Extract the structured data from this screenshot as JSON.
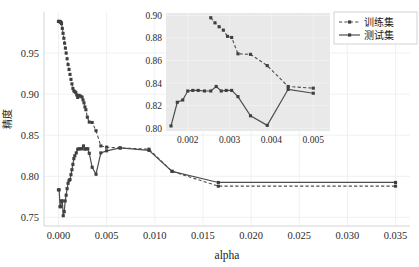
{
  "figure": {
    "background_color": "#ffffff",
    "line_color": "#4d4d4d",
    "marker_color": "#3f3f3f",
    "grid_color": "#eceff1",
    "inset_background_color": "#e9e9e9"
  },
  "legend": {
    "position": "top-right",
    "entries": [
      {
        "label": "训练集",
        "style": "dashed",
        "marker": "square"
      },
      {
        "label": "测试集",
        "style": "solid",
        "marker": "square"
      }
    ]
  },
  "chart_data": {
    "type": "line",
    "title": "",
    "xlabel": "alpha",
    "ylabel": "精度",
    "xlim": [
      -0.0015,
      0.0365
    ],
    "ylim": [
      0.7395,
      1.0
    ],
    "xticks": [
      0.0,
      0.005,
      0.01,
      0.015,
      0.02,
      0.025,
      0.03,
      0.035
    ],
    "xticklabels": [
      "0.000",
      "0.005",
      "0.010",
      "0.015",
      "0.020",
      "0.025",
      "0.030",
      "0.035"
    ],
    "yticks": [
      0.75,
      0.8,
      0.85,
      0.9,
      0.95
    ],
    "yticklabels": [
      "0.75",
      "0.80",
      "0.85",
      "0.90",
      "0.95"
    ],
    "grid": true,
    "legend_position": "upper right",
    "series": [
      {
        "name": "训练集",
        "style": "dashed",
        "marker": "square",
        "x": [
          0.0,
          4e-05,
          8e-05,
          0.00012,
          0.00016,
          0.0002,
          0.00024,
          0.00028,
          0.00032,
          0.0004,
          0.00048,
          0.00056,
          0.00064,
          0.00072,
          0.0008,
          0.0009,
          0.001,
          0.0011,
          0.0012,
          0.0013,
          0.0014,
          0.0015,
          0.0016,
          0.0017,
          0.0018,
          0.0019,
          0.002,
          0.00215,
          0.0023,
          0.00245,
          0.00255,
          0.00265,
          0.00275,
          0.00285,
          0.003,
          0.0032,
          0.0035,
          0.0039,
          0.0044,
          0.005,
          0.0064,
          0.0094,
          0.0118,
          0.0166,
          0.035
        ],
        "y": [
          0.9885,
          0.9885,
          0.9885,
          0.9885,
          0.9882,
          0.988,
          0.9876,
          0.987,
          0.9858,
          0.98,
          0.974,
          0.968,
          0.962,
          0.956,
          0.95,
          0.943,
          0.936,
          0.93,
          0.924,
          0.918,
          0.9125,
          0.907,
          0.904,
          0.903,
          0.902,
          0.899,
          0.896,
          0.8985,
          0.8975,
          0.8965,
          0.893,
          0.8895,
          0.8845,
          0.881,
          0.872,
          0.866,
          0.8655,
          0.8555,
          0.837,
          0.8355,
          0.8345,
          0.833,
          0.806,
          0.788,
          0.788
        ]
      },
      {
        "name": "测试集",
        "style": "solid",
        "marker": "square",
        "x": [
          0.0,
          8e-05,
          0.00016,
          0.00024,
          0.00032,
          0.0004,
          0.0005,
          0.0006,
          0.0007,
          0.0008,
          0.0009,
          0.001,
          0.0011,
          0.0012,
          0.0013,
          0.0014,
          0.0015,
          0.0016,
          0.0017,
          0.00185,
          0.002,
          0.00215,
          0.0023,
          0.00245,
          0.0026,
          0.00275,
          0.0029,
          0.00305,
          0.0032,
          0.0035,
          0.0039,
          0.0044,
          0.005,
          0.0064,
          0.0094,
          0.0118,
          0.0166,
          0.035
        ],
        "y": [
          0.7835,
          0.7835,
          0.763,
          0.763,
          0.77,
          0.77,
          0.752,
          0.757,
          0.77,
          0.777,
          0.785,
          0.7915,
          0.795,
          0.796,
          0.802,
          0.808,
          0.8145,
          0.8215,
          0.825,
          0.8285,
          0.833,
          0.8335,
          0.8335,
          0.8335,
          0.837,
          0.833,
          0.8335,
          0.8335,
          0.828,
          0.811,
          0.8025,
          0.8285,
          0.831,
          0.8345,
          0.8315,
          0.806,
          0.7925,
          0.7925
        ]
      }
    ],
    "inset": {
      "xlim": [
        0.00148,
        0.0054
      ],
      "ylim": [
        0.7975,
        0.9022
      ],
      "xticks": [
        0.002,
        0.003,
        0.004,
        0.005
      ],
      "xticklabels": [
        "0.002",
        "0.003",
        "0.004",
        "0.005"
      ],
      "yticks": [
        0.8,
        0.82,
        0.84,
        0.86,
        0.88,
        0.9
      ],
      "yticklabels": [
        "0.80",
        "0.82",
        "0.84",
        "0.86",
        "0.88",
        "0.90"
      ],
      "grid": true,
      "note": "zoom of main axes over alpha 0.0015-0.0054",
      "series": [
        {
          "name": "训练集",
          "style": "dashed",
          "marker": "square",
          "x": [
            0.00255,
            0.00265,
            0.00275,
            0.00285,
            0.00295,
            0.00305,
            0.0032,
            0.0035,
            0.0039,
            0.0044,
            0.005
          ],
          "y": [
            0.898,
            0.8935,
            0.89,
            0.887,
            0.8815,
            0.8805,
            0.866,
            0.8655,
            0.8555,
            0.837,
            0.8355
          ]
        },
        {
          "name": "测试集",
          "style": "solid",
          "marker": "square",
          "x": [
            0.0016,
            0.00175,
            0.00188,
            0.002,
            0.00212,
            0.00225,
            0.0024,
            0.00255,
            0.00268,
            0.0028,
            0.00292,
            0.00305,
            0.0032,
            0.0035,
            0.0039,
            0.0044,
            0.005
          ],
          "y": [
            0.802,
            0.823,
            0.825,
            0.833,
            0.8335,
            0.8335,
            0.833,
            0.833,
            0.837,
            0.833,
            0.8335,
            0.8335,
            0.828,
            0.811,
            0.8025,
            0.8345,
            0.831
          ]
        }
      ]
    }
  }
}
